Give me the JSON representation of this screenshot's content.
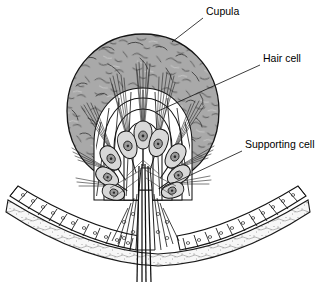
{
  "figure": {
    "name": "crista-ampullaris-cross-section",
    "background_color": "#ffffff",
    "width": 317,
    "height": 282
  },
  "labels": [
    {
      "id": "cupula",
      "text": "Cupula",
      "x": 206,
      "y": 15,
      "leader": {
        "x1": 203,
        "y1": 18,
        "x2": 172,
        "y2": 42
      }
    },
    {
      "id": "hair-cell",
      "text": "Hair cell",
      "x": 263,
      "y": 62,
      "leader": {
        "x1": 260,
        "y1": 65,
        "x2": 156,
        "y2": 112
      }
    },
    {
      "id": "supporting-cell",
      "text": "Supporting cell",
      "x": 245,
      "y": 148,
      "leader": {
        "x1": 242,
        "y1": 151,
        "x2": 163,
        "y2": 188
      }
    }
  ],
  "structures": {
    "cupula": {
      "label": "cupula-dome",
      "fill_color": "#a9a9a9",
      "stroke_color": "#1a1a1a",
      "texture": "mottled-squiggle",
      "center_x": 143,
      "center_y": 110,
      "radius": 76
    },
    "hair_cells": {
      "label": "hair-cell-group",
      "count": 10,
      "shape": "flask",
      "fill_color": "#d9d9d9",
      "nucleus_color": "#3a3a3a",
      "stereocilia": "apical-bundle"
    },
    "supporting_cells": {
      "label": "supporting-cell-layer",
      "shape": "columnar",
      "fill_color": "#ffffff",
      "stroke_color": "#1a1a1a"
    },
    "epithelium": {
      "label": "sensory-epithelium-arc",
      "cell_count_left": 14,
      "cell_count_right": 14,
      "fill_color": "#ffffff"
    },
    "basement_tissue": {
      "label": "connective-tissue-layer",
      "fill_color": "#f4f4f4",
      "texture": "stippled"
    },
    "nerve_fibers": {
      "label": "vestibular-nerve-bundle",
      "fiber_count": 4,
      "stroke_color": "#111111"
    }
  }
}
